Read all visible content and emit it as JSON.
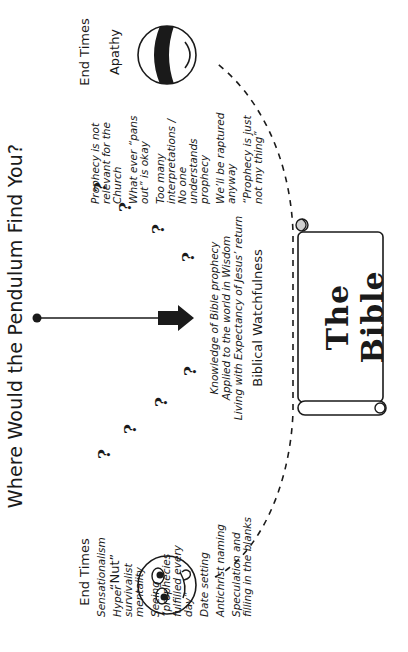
{
  "title": "Where Would the Pendulum Find You?",
  "left_pole": {
    "label_line1": "End Times",
    "label_line2": "“Nut”",
    "face": "wide-eyed-face-icon",
    "items": [
      "Sensationalism",
      "Hyper survivalist mentality",
      "Seeing “prophecies fulfilled every day”",
      "Date setting",
      "Antichrist naming",
      "Speculation and filling in the blanks"
    ]
  },
  "right_pole": {
    "label_line1": "End Times",
    "label_line2": "Apathy",
    "face": "blindfolded-face-icon",
    "items": [
      "Prophecy is not relevant for the Church",
      "What ever “pans out” is okay",
      "Too many interpretations / No one understands prophecy",
      "We’ll be raptured anyway",
      "“Prophecy is just not my thing”"
    ]
  },
  "center": {
    "lines": [
      "Knowledge of  Bible prophecy",
      "Applied to the world in Wisdom",
      "Living with Expectancy of Jesus’ return"
    ],
    "heading": "Biblical Watchfulness"
  },
  "question_mark": "?",
  "scroll": {
    "text": "The Bible"
  },
  "pendulum": {
    "pivot": "pivot-dot",
    "direction": "down-arrow"
  },
  "colors": {
    "ink": "#1a1a1a",
    "background": "#ffffff",
    "scroll_curl": "#d0d0d0"
  }
}
